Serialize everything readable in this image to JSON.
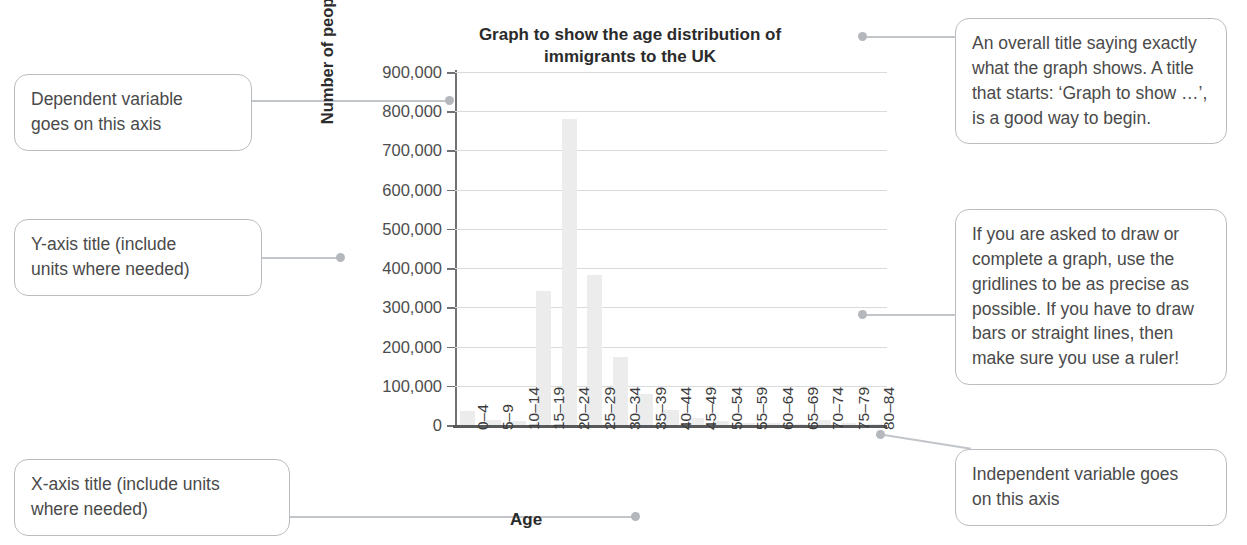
{
  "chart_data": {
    "type": "bar",
    "title": "Graph to show the age distribution of immigrants to the UK",
    "title_line1": "Graph to show the age distribution of",
    "title_line2": "immigrants to the UK",
    "xlabel": "Age",
    "ylabel": "Number of people",
    "ylim": [
      0,
      900000
    ],
    "grid": true,
    "legend": "none",
    "categories": [
      "0–4",
      "5–9",
      "10–14",
      "15–19",
      "20–24",
      "25–29",
      "30–34",
      "35–39",
      "40–44",
      "45–49",
      "50–54",
      "55–59",
      "60–64",
      "65–69",
      "70–74",
      "75–79",
      "80–84"
    ],
    "values": [
      35000,
      13000,
      11000,
      342000,
      780000,
      383000,
      173000,
      78000,
      38000,
      18000,
      9000,
      5000,
      4000,
      3000,
      12000,
      6000,
      3000
    ],
    "y_ticks": [
      0,
      100000,
      200000,
      300000,
      400000,
      500000,
      600000,
      700000,
      800000,
      900000
    ],
    "y_tick_labels": [
      "0",
      "100,000",
      "200,000",
      "300,000",
      "400,000",
      "500,000",
      "600,000",
      "700,000",
      "800,000",
      "900,000"
    ],
    "bar_color": "#ececec",
    "grid_color": "#d9dadb",
    "axis_color": "#58595b"
  },
  "callouts": {
    "dependent": "Dependent variable\ngoes on this axis",
    "y_axis": "Y-axis title (include\nunits where needed)",
    "x_axis": "X-axis title (include units\nwhere needed)",
    "title": "An overall title saying exactly what the graph shows. A title that starts: ‘Graph to show …’, is a good way to begin.",
    "gridlines": "If you are asked to draw or complete a graph, use the gridlines to be as precise as possible. If you have to draw bars or straight lines, then make sure you use a ruler!",
    "independent": "Independent variable goes\non this axis"
  }
}
